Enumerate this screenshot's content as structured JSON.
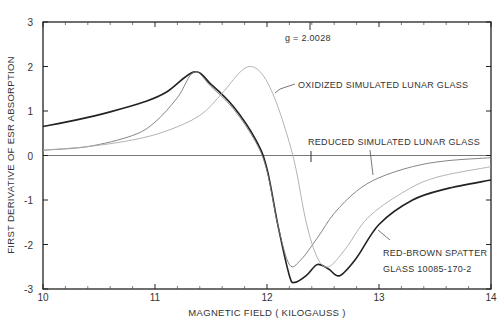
{
  "chart_data": {
    "type": "line",
    "title": "",
    "xlabel": "MAGNETIC FIELD ( KILOGAUSS )",
    "ylabel": "FIRST DERIVATIVE OF ESR ABSORPTION",
    "xlim": [
      10,
      14
    ],
    "ylim": [
      -3,
      3
    ],
    "x_ticks": [
      "10",
      "11",
      "12",
      "13",
      "14"
    ],
    "y_ticks": [
      "3",
      "2",
      "1",
      "0",
      "-1",
      "-2",
      "-3"
    ],
    "grid": false,
    "legend": "inline annotations",
    "annotations": {
      "g_value": "g = 2.0028",
      "oxidized": "OXIDIZED SIMULATED LUNAR GLASS",
      "reduced": "REDUCED SIMULATED LUNAR GLASS",
      "red_brown_line1": "RED-BROWN SPATTER",
      "red_brown_line2": "GLASS  10085-170-2"
    },
    "series": [
      {
        "name": "RED-BROWN SPATTER GLASS 10085-170-2",
        "color": "#222222",
        "x": [
          10.0,
          10.3,
          10.6,
          10.9,
          11.1,
          11.35,
          11.5,
          11.7,
          11.9,
          12.0,
          12.1,
          12.2,
          12.25,
          12.35,
          12.45,
          12.55,
          12.65,
          12.8,
          13.0,
          13.3,
          13.6,
          14.0
        ],
        "y": [
          0.65,
          0.8,
          0.98,
          1.2,
          1.42,
          1.88,
          1.6,
          1.1,
          0.35,
          -0.3,
          -1.6,
          -2.7,
          -2.85,
          -2.7,
          -2.45,
          -2.55,
          -2.7,
          -2.3,
          -1.55,
          -1.0,
          -0.75,
          -0.55
        ]
      },
      {
        "name": "REDUCED SIMULATED LUNAR GLASS",
        "color": "#777777",
        "x": [
          10.0,
          10.4,
          10.8,
          11.0,
          11.2,
          11.35,
          11.5,
          11.7,
          11.9,
          12.0,
          12.1,
          12.2,
          12.3,
          12.45,
          12.6,
          12.8,
          13.0,
          13.3,
          13.6,
          14.0
        ],
        "y": [
          0.12,
          0.2,
          0.45,
          0.75,
          1.3,
          1.88,
          1.55,
          1.05,
          0.3,
          -0.35,
          -1.6,
          -2.45,
          -2.35,
          -1.85,
          -1.3,
          -0.8,
          -0.5,
          -0.25,
          -0.12,
          -0.05
        ]
      },
      {
        "name": "OXIDIZED SIMULATED LUNAR GLASS",
        "color": "#aaaaaa",
        "x": [
          10.0,
          10.4,
          10.8,
          11.1,
          11.4,
          11.6,
          11.75,
          11.85,
          11.95,
          12.05,
          12.15,
          12.25,
          12.35,
          12.45,
          12.55,
          12.7,
          12.9,
          13.2,
          13.5,
          14.0
        ],
        "y": [
          0.12,
          0.2,
          0.35,
          0.55,
          0.9,
          1.4,
          1.85,
          2.0,
          1.85,
          1.4,
          0.7,
          -0.2,
          -1.5,
          -2.3,
          -2.5,
          -2.1,
          -1.4,
          -0.85,
          -0.5,
          -0.25
        ]
      }
    ]
  }
}
